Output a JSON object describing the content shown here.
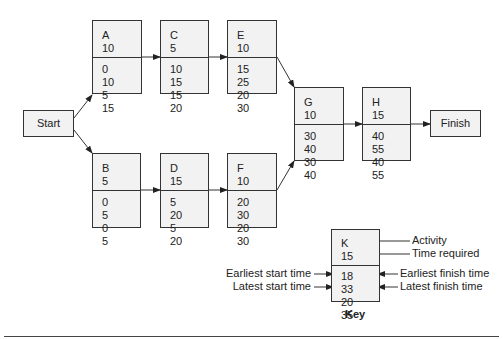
{
  "diagram": {
    "type": "activity-on-node network (PERT/CPM)",
    "start_label": "Start",
    "finish_label": "Finish",
    "activities": [
      {
        "id": "A",
        "time": "10",
        "es": "0",
        "ef": "10",
        "ls": "5",
        "lf": "15"
      },
      {
        "id": "C",
        "time": "5",
        "es": "10",
        "ef": "15",
        "ls": "15",
        "lf": "20"
      },
      {
        "id": "E",
        "time": "10",
        "es": "15",
        "ef": "25",
        "ls": "20",
        "lf": "30"
      },
      {
        "id": "B",
        "time": "5",
        "es": "0",
        "ef": "5",
        "ls": "0",
        "lf": "5"
      },
      {
        "id": "D",
        "time": "15",
        "es": "5",
        "ef": "20",
        "ls": "5",
        "lf": "20"
      },
      {
        "id": "F",
        "time": "10",
        "es": "20",
        "ef": "30",
        "ls": "20",
        "lf": "30"
      },
      {
        "id": "G",
        "time": "10",
        "es": "30",
        "ef": "40",
        "ls": "30",
        "lf": "40"
      },
      {
        "id": "H",
        "time": "15",
        "es": "40",
        "ef": "55",
        "ls": "40",
        "lf": "55"
      }
    ],
    "edges": [
      [
        "Start",
        "A"
      ],
      [
        "Start",
        "B"
      ],
      [
        "A",
        "C"
      ],
      [
        "C",
        "E"
      ],
      [
        "B",
        "D"
      ],
      [
        "D",
        "F"
      ],
      [
        "E",
        "G"
      ],
      [
        "F",
        "G"
      ],
      [
        "G",
        "H"
      ],
      [
        "H",
        "Finish"
      ]
    ]
  },
  "key": {
    "title": "Key",
    "example": {
      "id": "K",
      "time": "15",
      "es": "18",
      "ef": "33",
      "ls": "20",
      "lf": "35"
    },
    "labels": {
      "activity": "Activity",
      "time_required": "Time required",
      "earliest_start": "Earliest start time",
      "earliest_finish": "Earliest finish time",
      "latest_start": "Latest start time",
      "latest_finish": "Latest finish time"
    }
  }
}
